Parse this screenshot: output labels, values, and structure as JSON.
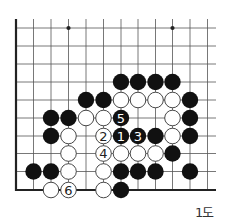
{
  "diagram": {
    "caption": "1도",
    "board": {
      "columns_x": [
        16,
        33.5,
        51,
        68.5,
        86,
        103.5,
        121,
        138,
        155.5,
        172.5,
        190,
        207.5
      ],
      "rows_y": [
        28,
        46,
        64,
        82,
        100,
        118,
        136,
        153.5,
        171.5,
        190
      ],
      "line_top": 19,
      "line_right": 216,
      "edge_left_col": 0,
      "edge_bottom_row": 9,
      "stone_radius": 8.2,
      "colors": {
        "line": "#555555",
        "edge": "#222222",
        "black": "#111111",
        "white": "#ffffff",
        "white_outline": "#333333"
      },
      "star_points": [
        {
          "col": 3,
          "row": 0
        },
        {
          "col": 9,
          "row": 0
        }
      ],
      "stones": [
        {
          "col": 6,
          "row": 3,
          "color": "black"
        },
        {
          "col": 7,
          "row": 3,
          "color": "black"
        },
        {
          "col": 8,
          "row": 3,
          "color": "black"
        },
        {
          "col": 9,
          "row": 3,
          "color": "black"
        },
        {
          "col": 4,
          "row": 4,
          "color": "black"
        },
        {
          "col": 5,
          "row": 4,
          "color": "black"
        },
        {
          "col": 6,
          "row": 4,
          "color": "white"
        },
        {
          "col": 7,
          "row": 4,
          "color": "white"
        },
        {
          "col": 8,
          "row": 4,
          "color": "white"
        },
        {
          "col": 9,
          "row": 4,
          "color": "white"
        },
        {
          "col": 10,
          "row": 4,
          "color": "black"
        },
        {
          "col": 2,
          "row": 5,
          "color": "black"
        },
        {
          "col": 3,
          "row": 5,
          "color": "black"
        },
        {
          "col": 4,
          "row": 5,
          "color": "white"
        },
        {
          "col": 5,
          "row": 5,
          "color": "white"
        },
        {
          "col": 6,
          "row": 5,
          "color": "black",
          "label": "5"
        },
        {
          "col": 9,
          "row": 5,
          "color": "white"
        },
        {
          "col": 10,
          "row": 5,
          "color": "black"
        },
        {
          "col": 2,
          "row": 6,
          "color": "black"
        },
        {
          "col": 3,
          "row": 6,
          "color": "white"
        },
        {
          "col": 5,
          "row": 6,
          "color": "white",
          "label": "2"
        },
        {
          "col": 6,
          "row": 6,
          "color": "black",
          "label": "1"
        },
        {
          "col": 7,
          "row": 6,
          "color": "black",
          "label": "3"
        },
        {
          "col": 8,
          "row": 6,
          "color": "black"
        },
        {
          "col": 9,
          "row": 6,
          "color": "white"
        },
        {
          "col": 10,
          "row": 6,
          "color": "black"
        },
        {
          "col": 3,
          "row": 7,
          "color": "white"
        },
        {
          "col": 5,
          "row": 7,
          "color": "white",
          "label": "4"
        },
        {
          "col": 6,
          "row": 7,
          "color": "white"
        },
        {
          "col": 7,
          "row": 7,
          "color": "white"
        },
        {
          "col": 8,
          "row": 7,
          "color": "white"
        },
        {
          "col": 9,
          "row": 7,
          "color": "black"
        },
        {
          "col": 1,
          "row": 8,
          "color": "black"
        },
        {
          "col": 2,
          "row": 8,
          "color": "black"
        },
        {
          "col": 3,
          "row": 8,
          "color": "white"
        },
        {
          "col": 5,
          "row": 8,
          "color": "white"
        },
        {
          "col": 6,
          "row": 8,
          "color": "black"
        },
        {
          "col": 7,
          "row": 8,
          "color": "black"
        },
        {
          "col": 8,
          "row": 8,
          "color": "black"
        },
        {
          "col": 10,
          "row": 8,
          "color": "black"
        },
        {
          "col": 2,
          "row": 9,
          "color": "white"
        },
        {
          "col": 3,
          "row": 9,
          "color": "white",
          "label": "6"
        },
        {
          "col": 5,
          "row": 9,
          "color": "white"
        },
        {
          "col": 6,
          "row": 9,
          "color": "black"
        }
      ]
    }
  }
}
